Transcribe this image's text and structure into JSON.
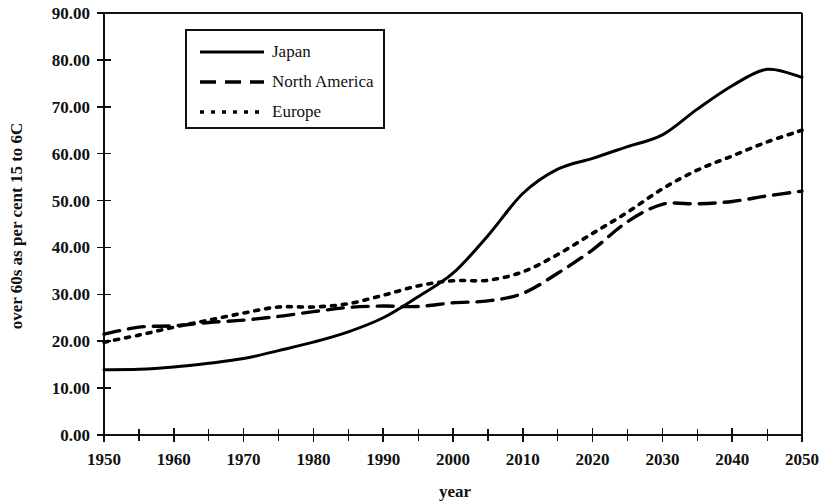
{
  "chart_data": {
    "type": "line",
    "title": "",
    "xlabel": "year",
    "ylabel": "over 60s as per cent 15 to 6C",
    "xlim": [
      1950,
      2050
    ],
    "ylim": [
      0,
      90
    ],
    "ytick_labels": [
      "0.00",
      "10.00",
      "20.00",
      "30.00",
      "40.00",
      "50.00",
      "60.00",
      "70.00",
      "80.00",
      "90.00"
    ],
    "ytick_values": [
      0,
      10,
      20,
      30,
      40,
      50,
      60,
      70,
      80,
      90
    ],
    "xtick_labels": [
      "1950",
      "1960",
      "1970",
      "1980",
      "1990",
      "2000",
      "2010",
      "2020",
      "2030",
      "2040",
      "2050"
    ],
    "xtick_values": [
      1950,
      1960,
      1970,
      1980,
      1990,
      2000,
      2010,
      2020,
      2030,
      2040,
      2050
    ],
    "xtick_minor_values": [
      1955,
      1965,
      1975,
      1985,
      1995,
      2005,
      2015,
      2025,
      2035,
      2045
    ],
    "grid": false,
    "legend_position": "upper-left-inside",
    "x": [
      1950,
      1955,
      1960,
      1965,
      1970,
      1975,
      1980,
      1985,
      1990,
      1995,
      2000,
      2005,
      2010,
      2015,
      2020,
      2025,
      2030,
      2035,
      2040,
      2045,
      2050
    ],
    "series": [
      {
        "name": "Japan",
        "style": "solid",
        "values": [
          13.9,
          14.0,
          14.5,
          15.3,
          16.3,
          18.0,
          19.8,
          22.0,
          25.0,
          29.5,
          34.5,
          42.5,
          51.5,
          56.7,
          59.0,
          61.5,
          64.0,
          69.5,
          74.5,
          78.0,
          76.3
        ]
      },
      {
        "name": "North America",
        "style": "dashed",
        "values": [
          21.5,
          23.0,
          23.3,
          24.0,
          24.5,
          25.3,
          26.3,
          27.2,
          27.5,
          27.4,
          28.2,
          28.6,
          30.2,
          34.5,
          39.5,
          45.5,
          49.2,
          49.3,
          49.8,
          51.0,
          52.0
        ]
      },
      {
        "name": "Europe",
        "style": "dotted",
        "values": [
          19.8,
          21.3,
          23.0,
          24.5,
          26.0,
          27.3,
          27.3,
          28.0,
          29.8,
          31.8,
          32.9,
          33.0,
          34.8,
          38.5,
          43.0,
          47.5,
          52.5,
          56.5,
          59.5,
          62.5,
          65.0
        ]
      }
    ],
    "legend_entries": [
      {
        "label": "Japan",
        "style": "solid"
      },
      {
        "label": "North America",
        "style": "dashed"
      },
      {
        "label": "Europe",
        "style": "dotted"
      }
    ]
  }
}
